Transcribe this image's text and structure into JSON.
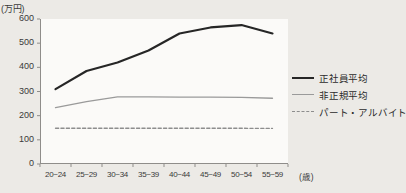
{
  "chart_data": {
    "type": "line",
    "title": "",
    "subtitle": "",
    "xlabel": "(歳)",
    "ylabel": "(万円)",
    "categories": [
      "20~24",
      "25~29",
      "30~34",
      "35~39",
      "40~44",
      "45~49",
      "50~54",
      "55~59"
    ],
    "ylim": [
      0,
      600
    ],
    "yticks": [
      0,
      100,
      200,
      300,
      400,
      500,
      600
    ],
    "ytick_labels": [
      "0",
      "100",
      "200",
      "300",
      "400",
      "500",
      "600"
    ],
    "grid": false,
    "legend_position": "right",
    "series": [
      {
        "name": "正社員平均",
        "style": "solid",
        "color": "#262626",
        "width": 2.2,
        "values": [
          310,
          385,
          420,
          470,
          540,
          565,
          575,
          540
        ]
      },
      {
        "name": "非正規平均",
        "style": "solid",
        "color": "#9a9a9a",
        "width": 1.3,
        "values": [
          233,
          258,
          278,
          278,
          277,
          277,
          276,
          272
        ]
      },
      {
        "name": "パート・アルバイト",
        "style": "dashed",
        "color": "#8d8d8d",
        "width": 1.3,
        "values": [
          148,
          148,
          148,
          148,
          148,
          148,
          148,
          147
        ]
      }
    ]
  },
  "axes": {
    "y_unit_label": "(万円)",
    "x_unit_label": "(歳)"
  },
  "legend": {
    "items": [
      {
        "label": "正社員平均"
      },
      {
        "label": "非正規平均"
      },
      {
        "label": "パート・アルバイト"
      }
    ]
  },
  "colors": {
    "page_background": "#eceae6",
    "plot_background": "#fbfaf8",
    "axis": "#8f8d8a",
    "text": "#3a3a3a",
    "series_regular": "#262626",
    "series_nonregular": "#9a9a9a",
    "series_parttime": "#8d8d8d"
  }
}
